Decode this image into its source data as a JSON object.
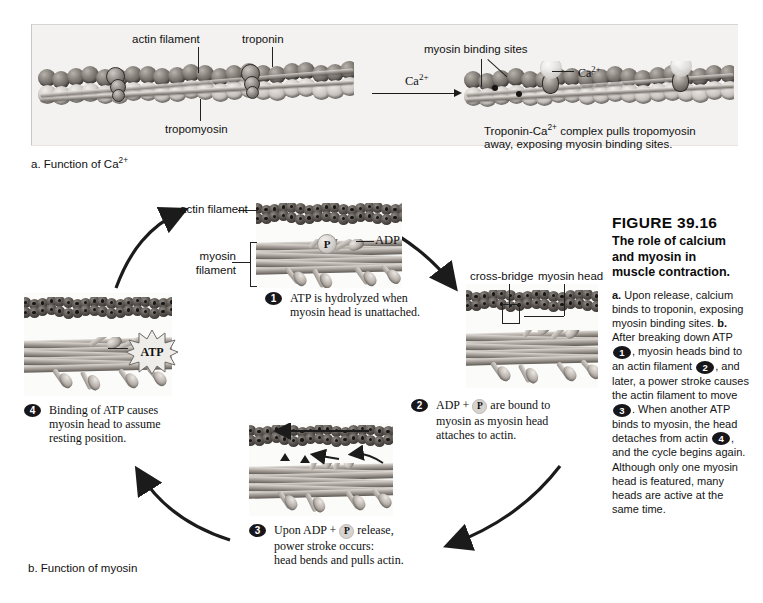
{
  "figure": {
    "number": "FIGURE 39.16",
    "title_line1": "The role of calcium",
    "title_line2": "and myosin in",
    "title_line3": "muscle contraction.",
    "caption_a_prefix": "a.",
    "caption_a_text": " Upon release, calcium binds to troponin, exposing myosin binding sites. ",
    "caption_b_prefix": "b.",
    "caption_b_seg1": " After breaking down ATP ",
    "caption_b_seg2": ", myosin heads bind to an actin filament ",
    "caption_b_seg3": ", and later, a power stroke causes the actin filament to move ",
    "caption_b_seg4": ". When another ATP binds to myosin, the head detaches from actin ",
    "caption_b_seg5": ", and the cycle begins again. Although only one myosin head is featured, many heads are active at the same time.",
    "badge1": "1",
    "badge2": "2",
    "badge3": "3",
    "badge4": "4"
  },
  "panel_a": {
    "part_label": "a. Function of Ca",
    "part_label_sup": "2+",
    "labels": {
      "actin_filament": "actin filament",
      "troponin": "troponin",
      "tropomyosin": "tropomyosin",
      "myosin_binding_sites": "myosin binding sites",
      "calcium_ion": "Ca",
      "calcium_ion_sup": "2+"
    },
    "reaction_arrow_label": "Ca",
    "reaction_arrow_label_sup": "2+",
    "result_line1": "Troponin-Ca",
    "result_line1_sup": "2+",
    "result_line1_rest": " complex pulls tropomyosin",
    "result_line2": "away, exposing myosin binding sites."
  },
  "panel_b": {
    "part_label": "b. Function of myosin",
    "labels": {
      "actin_filament": "actin filament",
      "myosin_filament_line1": "myosin",
      "myosin_filament_line2": "filament",
      "cross_bridge": "cross-bridge",
      "myosin_head": "myosin head",
      "adp": "ADP",
      "p_token": "P",
      "atp": "ATP"
    },
    "steps": [
      {
        "number": "1",
        "line1": "ATP is hydrolyzed when",
        "line2": "myosin head is unattached.",
        "line3": ""
      },
      {
        "number": "2",
        "line1_a": "ADP + ",
        "line1_b": " are bound to",
        "line2": "myosin as myosin head",
        "line3": "attaches to actin."
      },
      {
        "number": "3",
        "line1_a": "Upon ADP + ",
        "line1_b": " release,",
        "line2": "power stroke occurs:",
        "line3": "head bends and pulls actin."
      },
      {
        "number": "4",
        "line1": "Binding of ATP causes",
        "line2": "myosin head to assume",
        "line3": "resting position."
      }
    ]
  },
  "colors": {
    "panel_a_background": "#f3f2f0",
    "step_panel_background": "#fbfbfa",
    "badge_background": "#17161a",
    "text": "#111111",
    "arrow": "#1b1b1b"
  }
}
